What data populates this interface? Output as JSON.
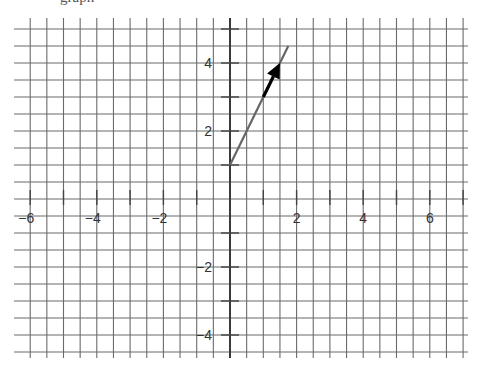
{
  "header": {
    "clipped_text": "graph"
  },
  "chart_data": {
    "type": "line",
    "title": "",
    "xlabel": "",
    "ylabel": "",
    "xlim": [
      -6,
      7
    ],
    "ylim": [
      -4.5,
      5
    ],
    "grid": true,
    "grid_step": 0.5,
    "x_tick_labels": [
      "-6",
      "-4",
      "-2",
      "2",
      "4",
      "6"
    ],
    "y_tick_labels": [
      "4",
      "2",
      "-2",
      "-4"
    ],
    "series": [
      {
        "name": "line y = 2x + 1",
        "x": [
          0,
          1.75
        ],
        "y": [
          1,
          4.5
        ],
        "color": "#666666"
      }
    ],
    "annotations": [
      {
        "type": "arrow",
        "from": [
          1,
          3
        ],
        "to": [
          1.5,
          4
        ],
        "color": "#000000",
        "description": "direction vector along line"
      }
    ]
  }
}
